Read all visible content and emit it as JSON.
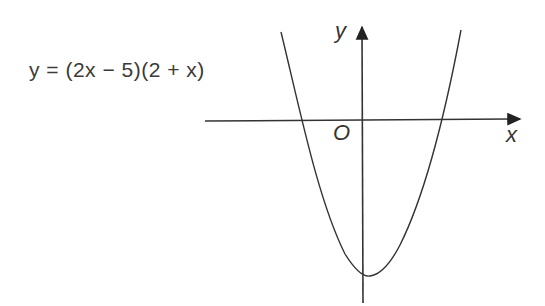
{
  "diagram": {
    "equation": "y = (2x − 5)(2 + x)",
    "axis_labels": {
      "x": "x",
      "y": "y",
      "origin": "O"
    },
    "curve": {
      "type": "parabola",
      "opens": "up",
      "roots": [
        -2,
        2.5
      ],
      "y_intercept": -10,
      "vertex": [
        0.25,
        -10.125
      ]
    },
    "colors": {
      "ink": "#333333",
      "background": "#ffffff"
    }
  }
}
